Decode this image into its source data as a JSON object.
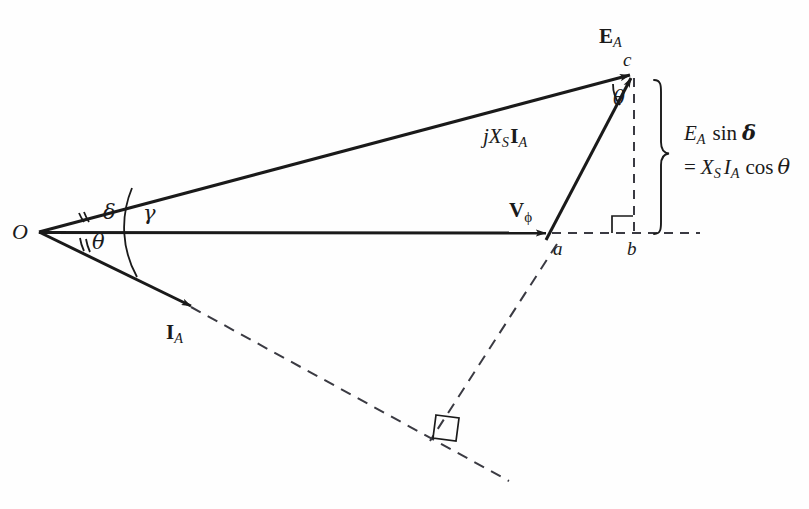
{
  "figure": {
    "type": "phasor-diagram",
    "background_color": "#fefefe",
    "stroke_color": "#1a1a1a"
  },
  "points": {
    "origin": {
      "label": "O",
      "x": 37,
      "y": 232
    },
    "a": {
      "label": "a",
      "x": 551,
      "y": 249
    },
    "b": {
      "label": "b",
      "x": 631,
      "y": 250
    },
    "c": {
      "label": "c",
      "x": 630,
      "y": 62
    }
  },
  "phasors": [
    {
      "name": "EA",
      "label": "E",
      "sub": "A",
      "from": "O",
      "to": "c",
      "style": "solid-arrow"
    },
    {
      "name": "Vphi",
      "label": "V",
      "sub": "ϕ",
      "from": "O",
      "to": "a",
      "style": "solid-arrow"
    },
    {
      "name": "jXsIA",
      "label": "jX",
      "sub1": "S",
      "label2": "I",
      "sub2": "A",
      "from": "a",
      "to": "c",
      "style": "solid-arrow"
    },
    {
      "name": "IA",
      "label": "I",
      "sub": "A",
      "from": "O",
      "to": "arrowtip",
      "style": "solid-arrow-then-dashed"
    }
  ],
  "labels": {
    "origin": "O",
    "point_a": "a",
    "point_b": "b",
    "point_c": "c",
    "ea_main": "E",
    "ea_sub": "A",
    "vphi_main": "V",
    "vphi_sub": "ϕ",
    "jxsia_j": "j",
    "jxsia_x": "X",
    "jxsia_x_sub": "S",
    "jxsia_i": "I",
    "jxsia_i_sub": "A",
    "ia_main": "I",
    "ia_sub": "A",
    "angle_theta_origin": "θ",
    "angle_delta": "δ",
    "angle_gamma": "γ",
    "angle_theta_top": "θ",
    "brace_line1_e": "E",
    "brace_line1_e_sub": "A",
    "brace_line1_fn": "sin",
    "brace_line1_delta": "δ",
    "brace_line2_eq": "=",
    "brace_line2_x": "X",
    "brace_line2_x_sub": "S",
    "brace_line2_i": "I",
    "brace_line2_i_sub": "A",
    "brace_line2_fn": "cos",
    "brace_line2_theta": "θ"
  },
  "annotations": {
    "brace_text_line1": "E_A sin δ",
    "brace_text_line2": "= X_S I_A cos θ",
    "right_angle_at_b": true,
    "right_angle_lower": true
  },
  "geometry": {
    "ea_line": {
      "x1": 37,
      "y1": 232,
      "x2": 633,
      "y2": 74
    },
    "vphi_line": {
      "x1": 37,
      "y1": 232,
      "x2": 549,
      "y2": 233
    },
    "jxsia_line": {
      "x1": 546,
      "y1": 239,
      "x2": 632,
      "y2": 76
    },
    "ia_solid": {
      "x1": 37,
      "y1": 232,
      "x2": 196,
      "y2": 309
    },
    "ia_dashed": {
      "x1": 193,
      "y1": 308,
      "x2": 509,
      "y2": 481
    },
    "cb_dashed": {
      "x1": 634,
      "y1": 75,
      "x2": 634,
      "y2": 233
    },
    "ab_dashed": {
      "x1": 549,
      "y1": 233,
      "x2": 700,
      "y2": 233
    },
    "a_lower_dashed": {
      "x1": 556,
      "y1": 247,
      "x2": 437,
      "y2": 430
    },
    "right_angle_box_lower": {
      "cx": 447,
      "cy": 423
    }
  }
}
